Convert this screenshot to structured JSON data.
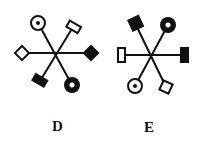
{
  "figures": [
    {
      "label": "D",
      "center": [
        55,
        53
      ],
      "spokes": [
        {
          "angle_deg": 180,
          "end": [
            22,
            53
          ],
          "symbol": "hollow-diamond"
        },
        {
          "angle_deg": 0,
          "end": [
            91,
            53
          ],
          "symbol": "filled-diamond"
        },
        {
          "angle_deg": 240,
          "end": [
            38,
            23
          ],
          "symbol": "dotted-circle"
        },
        {
          "angle_deg": 300,
          "end": [
            73,
            27
          ],
          "symbol": "hollow-rectangle"
        },
        {
          "angle_deg": 120,
          "end": [
            40,
            81
          ],
          "symbol": "filled-rectangle"
        },
        {
          "angle_deg": 60,
          "end": [
            72,
            85
          ],
          "symbol": "thick-ring"
        }
      ]
    },
    {
      "label": "E",
      "center": [
        151,
        57
      ],
      "spokes": [
        {
          "angle_deg": 180,
          "end": [
            121,
            55
          ],
          "symbol": "hollow-vertical-rectangle"
        },
        {
          "angle_deg": 0,
          "end": [
            184,
            55
          ],
          "symbol": "filled-vertical-rectangle"
        },
        {
          "angle_deg": 240,
          "end": [
            135,
            23
          ],
          "symbol": "filled-square"
        },
        {
          "angle_deg": 300,
          "end": [
            168,
            25
          ],
          "symbol": "thick-ring"
        },
        {
          "angle_deg": 120,
          "end": [
            135,
            86
          ],
          "symbol": "dotted-circle"
        },
        {
          "angle_deg": 60,
          "end": [
            166,
            87
          ],
          "symbol": "hollow-square"
        }
      ]
    }
  ],
  "labels": {
    "d": "D",
    "e": "E"
  },
  "colors": {
    "ink": "#111111",
    "paper": "#ffffff"
  }
}
